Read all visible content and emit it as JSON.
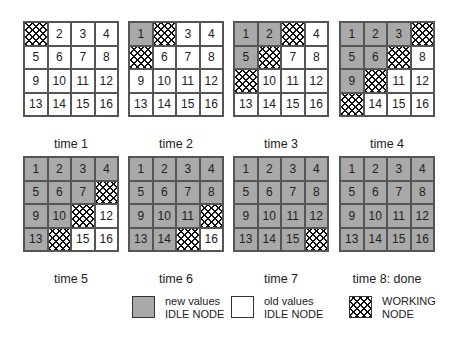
{
  "panels": [
    {
      "caption": "time 1",
      "states": [
        "W",
        "O",
        "O",
        "O",
        "O",
        "O",
        "O",
        "O",
        "O",
        "O",
        "O",
        "O",
        "O",
        "O",
        "O",
        "O"
      ]
    },
    {
      "caption": "time 2",
      "states": [
        "N",
        "W",
        "O",
        "O",
        "W",
        "O",
        "O",
        "O",
        "O",
        "O",
        "O",
        "O",
        "O",
        "O",
        "O",
        "O"
      ]
    },
    {
      "caption": "time 3",
      "states": [
        "N",
        "N",
        "W",
        "O",
        "N",
        "W",
        "O",
        "O",
        "W",
        "O",
        "O",
        "O",
        "O",
        "O",
        "O",
        "O"
      ]
    },
    {
      "caption": "time 4",
      "states": [
        "N",
        "N",
        "N",
        "W",
        "N",
        "N",
        "W",
        "O",
        "N",
        "W",
        "O",
        "O",
        "W",
        "O",
        "O",
        "O"
      ]
    },
    {
      "caption": "time 5",
      "states": [
        "N",
        "N",
        "N",
        "N",
        "N",
        "N",
        "N",
        "W",
        "N",
        "N",
        "W",
        "O",
        "N",
        "W",
        "O",
        "O"
      ]
    },
    {
      "caption": "time 6",
      "states": [
        "N",
        "N",
        "N",
        "N",
        "N",
        "N",
        "N",
        "N",
        "N",
        "N",
        "N",
        "W",
        "N",
        "N",
        "W",
        "O"
      ]
    },
    {
      "caption": "time 7",
      "states": [
        "N",
        "N",
        "N",
        "N",
        "N",
        "N",
        "N",
        "N",
        "N",
        "N",
        "N",
        "N",
        "N",
        "N",
        "N",
        "W"
      ]
    },
    {
      "caption": "time 8: done",
      "states": [
        "N",
        "N",
        "N",
        "N",
        "N",
        "N",
        "N",
        "N",
        "N",
        "N",
        "N",
        "N",
        "N",
        "N",
        "N",
        "N"
      ]
    }
  ],
  "cell_labels": [
    "1",
    "2",
    "3",
    "4",
    "5",
    "6",
    "7",
    "8",
    "9",
    "10",
    "11",
    "12",
    "13",
    "14",
    "15",
    "16"
  ],
  "legend": {
    "new": {
      "line1": "new values",
      "line2": "IDLE NODE"
    },
    "old": {
      "line1": "old values",
      "line2": "IDLE NODE"
    },
    "working": {
      "line1": "WORKING",
      "line2": "NODE"
    }
  },
  "colors": {
    "new_values": "#a9a9a9",
    "old_values": "#ffffff",
    "working_hatch": "#111111"
  }
}
